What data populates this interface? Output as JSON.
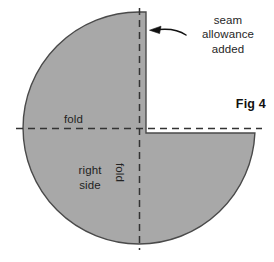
{
  "figure": {
    "id": "fig-4",
    "caption": "Fig 4",
    "background_color": "#ffffff",
    "fabric_fill": "#a8a8a8",
    "outline_color": "#4a4a4a",
    "dash_color": "#3a3a3a",
    "arrow_color": "#111111",
    "annotations": {
      "seam_allowance": {
        "line1": "seam",
        "line2": "allowance",
        "line3": "added"
      },
      "fold_horizontal": "fold",
      "fold_vertical": "fold",
      "right_side": {
        "line1": "right",
        "line2": "side"
      }
    },
    "icons": {
      "pointer": "curved-arrow-icon"
    },
    "geometry": {
      "circle_center_x": 139,
      "circle_center_y": 128,
      "circle_radius": 116,
      "notch_corner_x": 146,
      "notch_corner_y": 126,
      "fold_line_y": 128,
      "fold_line_x": 139
    }
  }
}
